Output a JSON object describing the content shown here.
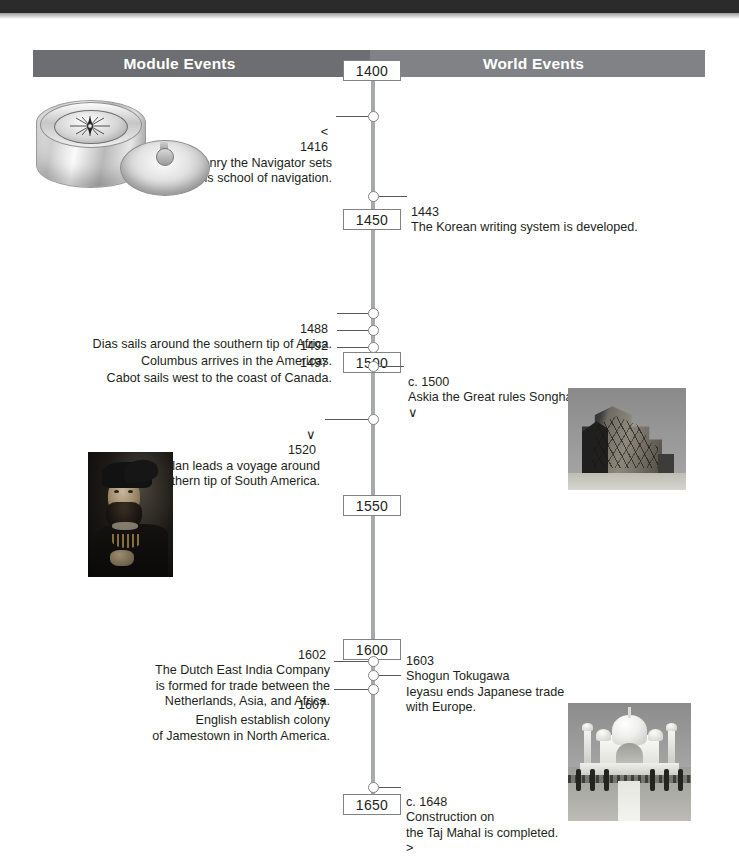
{
  "header": {
    "left_title": "Module Events",
    "right_title": "World Events"
  },
  "timeline": {
    "year_markers": [
      "1400",
      "1450",
      "1500",
      "1550",
      "1600",
      "1650"
    ],
    "events": [
      {
        "side": "left",
        "chevron": "<",
        "year": "1416",
        "text": "Henry the Navigator sets\nup his school of navigation."
      },
      {
        "side": "right",
        "chevron": "",
        "year": "1443",
        "text": "The Korean writing system is developed."
      },
      {
        "side": "left",
        "chevron": "",
        "year": "1488",
        "text": "Dias sails around the southern tip of Africa."
      },
      {
        "side": "left",
        "chevron": "",
        "year": "1492",
        "text": "Columbus arrives in the Americas."
      },
      {
        "side": "left",
        "chevron": "",
        "year": "1497",
        "text": "Cabot sails west to the coast of Canada."
      },
      {
        "side": "right",
        "chevron": "",
        "year": "c. 1500",
        "text": "Askia the Great rules Songhai.",
        "chevron_after": "∨"
      },
      {
        "side": "left",
        "chevron": "∨",
        "year": "1520",
        "text": "Magellan leads a voyage around\nthe southern tip of South America."
      },
      {
        "side": "left",
        "chevron": "",
        "year": "1602",
        "text": "The Dutch East India Company\nis formed for trade between the\nNetherlands, Asia, and Africa."
      },
      {
        "side": "right",
        "chevron": "",
        "year": "1603",
        "text": "Shogun Tokugawa\nIeyasu ends Japanese trade\nwith Europe."
      },
      {
        "side": "left",
        "chevron": "",
        "year": "1607",
        "text": "English establish colony\nof Jamestown in North America."
      },
      {
        "side": "right",
        "chevron": "",
        "year": "c. 1648",
        "text": "Construction on\nthe Taj Mahal is completed.",
        "chevron_after": ">"
      }
    ]
  },
  "images": {
    "compass": "mariners-compass-photo",
    "tomb": "tomb-of-askia-photo",
    "magellan": "magellan-portrait-photo",
    "taj": "taj-mahal-photo"
  },
  "colors": {
    "header_left": "#6d6e71",
    "header_right": "#808285",
    "spine": "#a7a9ac",
    "text": "#231f20"
  }
}
